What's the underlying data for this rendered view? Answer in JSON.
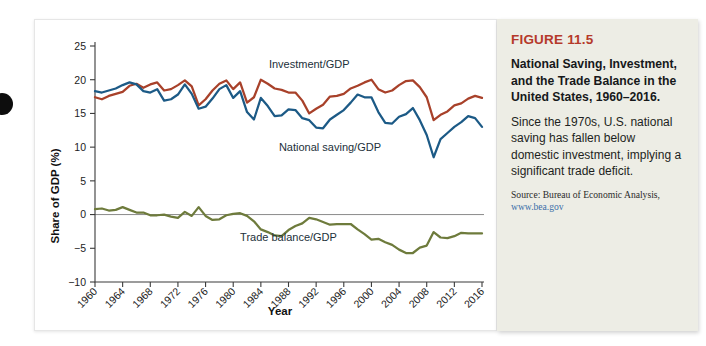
{
  "figure": {
    "number_label": "FIGURE 11.5",
    "title": "National Saving, Investment, and the Trade Balance in the United States, 1960–2016.",
    "description": "Since the 1970s, U.S. national saving has fallen below domestic investment, implying a significant trade deficit.",
    "source": "Source: Bureau of Economic Analysis,",
    "source_url": "www.bea.gov",
    "accent_color": "#b5392a",
    "panel_bg": "#ededE5"
  },
  "chart_data": {
    "type": "line",
    "title": "",
    "xlabel": "Year",
    "ylabel": "Share of GDP (%)",
    "xlim": [
      1960,
      2016
    ],
    "ylim": [
      -10,
      25
    ],
    "yticks": [
      -10,
      -5,
      0,
      5,
      10,
      15,
      20,
      25
    ],
    "ytick_labels": [
      "−10",
      "−5",
      "0",
      "5",
      "10",
      "15",
      "20",
      "25"
    ],
    "xticks": [
      1960,
      1964,
      1968,
      1972,
      1976,
      1980,
      1984,
      1988,
      1992,
      1996,
      2000,
      2004,
      2008,
      2012,
      2016
    ],
    "xtick_labels": [
      "1960",
      "1964",
      "1968",
      "1972",
      "1976",
      "1980",
      "1984",
      "1988",
      "1992",
      "1996",
      "2000",
      "2004",
      "2008",
      "2012",
      "2016"
    ],
    "grid": false,
    "legend_position": "inline-annotations",
    "zero_reference_line": 0,
    "x": [
      1960,
      1961,
      1962,
      1963,
      1964,
      1965,
      1966,
      1967,
      1968,
      1969,
      1970,
      1971,
      1972,
      1973,
      1974,
      1975,
      1976,
      1977,
      1978,
      1979,
      1980,
      1981,
      1982,
      1983,
      1984,
      1985,
      1986,
      1987,
      1988,
      1989,
      1990,
      1991,
      1992,
      1993,
      1994,
      1995,
      1996,
      1997,
      1998,
      1999,
      2000,
      2001,
      2002,
      2003,
      2004,
      2005,
      2006,
      2007,
      2008,
      2009,
      2010,
      2011,
      2012,
      2013,
      2014,
      2015,
      2016
    ],
    "series": [
      {
        "name": "Investment/GDP",
        "color": "#a8412a",
        "label_x": 1991,
        "label_y": 21.8,
        "values": [
          17.4,
          17.1,
          17.6,
          17.9,
          18.2,
          19.1,
          19.4,
          18.8,
          19.3,
          19.6,
          18.4,
          18.6,
          19.2,
          19.9,
          19.0,
          16.2,
          17.1,
          18.4,
          19.4,
          19.9,
          18.6,
          19.6,
          16.6,
          17.4,
          20.0,
          19.4,
          18.7,
          18.5,
          18.1,
          18.1,
          16.9,
          15.0,
          15.7,
          16.3,
          17.5,
          17.6,
          17.9,
          18.7,
          19.1,
          19.6,
          20.0,
          18.6,
          18.1,
          18.4,
          19.2,
          19.8,
          19.9,
          18.9,
          17.4,
          14.0,
          14.8,
          15.3,
          16.2,
          16.5,
          17.2,
          17.6,
          17.3
        ]
      },
      {
        "name": "National saving/GDP",
        "color": "#1c5a86",
        "label_x": 1994,
        "label_y": 9.4,
        "values": [
          18.3,
          18.1,
          18.4,
          18.7,
          19.2,
          19.6,
          19.3,
          18.3,
          18.1,
          18.6,
          16.9,
          17.1,
          17.8,
          19.3,
          17.9,
          15.7,
          16.0,
          17.2,
          18.6,
          19.2,
          17.3,
          18.3,
          15.2,
          14.1,
          17.3,
          16.1,
          14.6,
          14.7,
          15.6,
          15.5,
          14.3,
          14.0,
          12.9,
          12.8,
          14.1,
          14.8,
          15.5,
          16.6,
          17.8,
          17.4,
          17.4,
          15.2,
          13.6,
          13.5,
          14.5,
          14.9,
          15.8,
          14.0,
          11.8,
          8.5,
          11.2,
          12.1,
          13.0,
          13.7,
          14.6,
          14.3,
          13.0
        ]
      },
      {
        "name": "Trade balance/GDP",
        "color": "#6e7b3c",
        "label_x": 1988,
        "label_y": -3.9,
        "values": [
          0.8,
          0.9,
          0.6,
          0.7,
          1.1,
          0.7,
          0.3,
          0.3,
          -0.1,
          -0.1,
          0.0,
          -0.3,
          -0.5,
          0.4,
          -0.2,
          1.1,
          -0.2,
          -0.8,
          -0.7,
          -0.1,
          0.1,
          0.2,
          -0.2,
          -1.0,
          -2.2,
          -2.6,
          -3.1,
          -3.2,
          -2.3,
          -1.7,
          -1.3,
          -0.5,
          -0.7,
          -1.1,
          -1.5,
          -1.4,
          -1.4,
          -1.4,
          -2.2,
          -2.9,
          -3.7,
          -3.6,
          -4.1,
          -4.5,
          -5.2,
          -5.7,
          -5.7,
          -4.9,
          -4.6,
          -2.6,
          -3.4,
          -3.5,
          -3.2,
          -2.7,
          -2.8,
          -2.8,
          -2.8
        ]
      }
    ]
  }
}
